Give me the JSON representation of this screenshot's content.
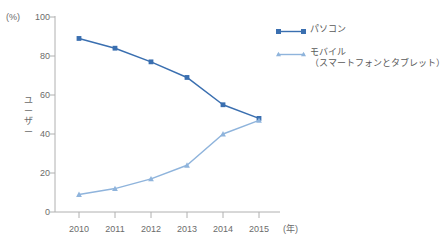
{
  "axes": {
    "unit_label": "(%)",
    "y_title_chars": [
      "ユ",
      "ー",
      "ザ",
      "ー"
    ],
    "y_ticks": [
      "0",
      "20",
      "40",
      "60",
      "80",
      "100"
    ],
    "x_ticks": [
      "2010",
      "2011",
      "2012",
      "2013",
      "2014",
      "2015"
    ],
    "x_unit_label": "(年)"
  },
  "legend": {
    "pc_label": "パソコン",
    "mobile_label": "モバイル",
    "mobile_sublabel": "（スマートフォンとタブレット）"
  },
  "colors": {
    "pc": "#3A6FB0",
    "mobile": "#8FB4DC",
    "axis": "#b0b0b0",
    "text": "#6b6b6b"
  },
  "chart_data": {
    "type": "line",
    "title": "",
    "subtitle": "",
    "xlabel": "(年)",
    "ylabel": "ユーザー (%)",
    "x": [
      "2010",
      "2011",
      "2012",
      "2013",
      "2014",
      "2015"
    ],
    "xlim": [
      "2010",
      "2015"
    ],
    "ylim": [
      0,
      100
    ],
    "yticks": [
      0,
      20,
      40,
      60,
      80,
      100
    ],
    "grid": false,
    "legend_position": "right",
    "series": [
      {
        "name": "パソコン",
        "color": "#3A6FB0",
        "marker": "square",
        "values": [
          89,
          84,
          77,
          69,
          55,
          48
        ]
      },
      {
        "name": "モバイル（スマートフォンとタブレット）",
        "color": "#8FB4DC",
        "marker": "triangle",
        "values": [
          9,
          12,
          17,
          24,
          40,
          47
        ]
      }
    ]
  }
}
